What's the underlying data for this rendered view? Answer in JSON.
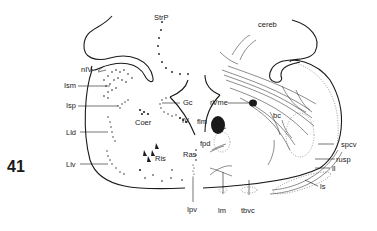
{
  "figure": {
    "number": "41",
    "labels": {
      "StrP": "StrP",
      "cereb": "cereb",
      "nIV": "nIV",
      "Ism": "Ism",
      "Isp": "Isp",
      "Gc": "Gc",
      "rVme": "rVme",
      "Coer": "Coer",
      "IV": "IV",
      "flm": "flm",
      "bc": "bc",
      "fpd": "fpd",
      "Lld": "Lld",
      "Ris": "Ris",
      "Ras": "Ras",
      "spcv": "spcv",
      "rusp": "rusp",
      "ll": "ll",
      "Llv": "Llv",
      "ls": "ls",
      "Ipv": "Ipv",
      "lm": "lm",
      "tbvc": "tbvc"
    }
  }
}
